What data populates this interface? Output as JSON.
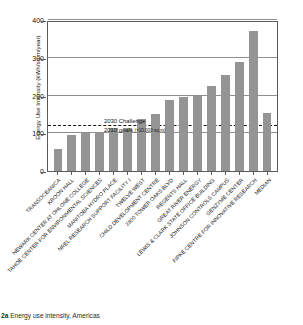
{
  "figure": {
    "caption_number": "2a",
    "caption_text": "Energy use intensity, Americas"
  },
  "annotation": {
    "line1": "2030 Challenge",
    "line2": "2010 goals",
    "line2_sub": "(>10,000 sq.m)"
  },
  "colors": {
    "bar": "#949494",
    "grid": "#8e8e8e",
    "axis": "#5a5a5a",
    "threshold": "#141414",
    "background": "#ffffff"
  },
  "chart_data": {
    "type": "bar",
    "title": "Energy use intensity, Americas",
    "xlabel": "",
    "ylabel": "Energy Use Intensity (kWh/sq m/year)",
    "ylim": [
      0,
      400
    ],
    "yticks": [
      0,
      100,
      200,
      300,
      400
    ],
    "ytick_labels": [
      "0",
      "100",
      "200",
      "300",
      "400"
    ],
    "grid": true,
    "grid_axis": "y",
    "legend": false,
    "orientation": "vertical",
    "categories": [
      "TRANSOCEANICA",
      "KROON HALL",
      "NEWARK CENTER AT OHLONE COLLEGE",
      "TAHOE CENTER FOR ENVIRONMENTAL SCIENCES",
      "MANITOBA HYDRO PLACE",
      "NREL RESEARCH SUPPORT FACILITY I",
      "TWELVE WEST",
      "CHILD DEVELOPMENT CENTRE",
      "2800 TOWER OAKS BLVD",
      "REGENTS HALL",
      "GREAT RIVER ENERGY",
      "LEWIS & CLARK STATE OFFICE BUILDING",
      "JOHNSON CONTROLS CAMPUS",
      "GENZYME CENTER",
      "FIPKE CENTRE FOR INNOVATIVE RESEARCH",
      "MEDIAN"
    ],
    "values": [
      57,
      96,
      101,
      103,
      113,
      113,
      138,
      152,
      189,
      195,
      200,
      224,
      255,
      289,
      370,
      154
    ],
    "annotations": [
      {
        "type": "hline",
        "value": 120,
        "style": "dashed",
        "label": "2030 Challenge 2010 goals (>10,000 sq.m)"
      },
      {
        "type": "hline",
        "value": 100,
        "style": "solid",
        "label": ""
      }
    ]
  }
}
